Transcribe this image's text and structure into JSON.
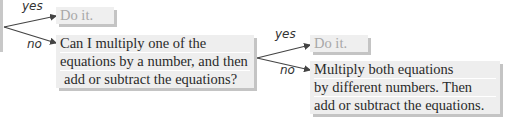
{
  "diagram": {
    "type": "decision-tree",
    "branch1": {
      "yes_label": "yes",
      "no_label": "no",
      "yes_result": "Do it.",
      "no_question": {
        "lines": [
          "Can I multiply one of the",
          "equations by a number, and then",
          "add or subtract the equations?"
        ]
      }
    },
    "branch2": {
      "yes_label": "yes",
      "no_label": "no",
      "yes_result": "Do it.",
      "no_result": {
        "lines": [
          "Multiply both equations",
          "by different numbers. Then",
          "add or subtract the equations."
        ]
      }
    }
  },
  "colors": {
    "box_fill": "#eeeeee",
    "box_shadow": "#c4c4c4",
    "muted_text": "#a8a8a8",
    "arrow": "#444444"
  }
}
